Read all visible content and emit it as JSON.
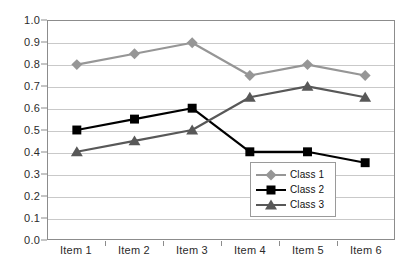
{
  "chart_data": {
    "type": "line",
    "title": "",
    "subtitle": "",
    "xlabel": "",
    "ylabel": "",
    "categories": [
      "Item 1",
      "Item 2",
      "Item 3",
      "Item 4",
      "Item 5",
      "Item 6"
    ],
    "ylim": [
      0.0,
      1.0
    ],
    "ytick_step": 0.1,
    "yticks": [
      "0.0",
      "0.1",
      "0.2",
      "0.3",
      "0.4",
      "0.5",
      "0.6",
      "0.7",
      "0.8",
      "0.9",
      "1.0"
    ],
    "ytick_values": [
      0.0,
      0.1,
      0.2,
      0.3,
      0.4,
      0.5,
      0.6,
      0.7,
      0.8,
      0.9,
      1.0
    ],
    "grid": true,
    "grid_axis": "y",
    "legend_position": "bottom-right-inside",
    "series": [
      {
        "name": "Class 1",
        "values": [
          0.8,
          0.85,
          0.9,
          0.75,
          0.8,
          0.75
        ],
        "color": "#969696",
        "marker": "diamond"
      },
      {
        "name": "Class 2",
        "values": [
          0.5,
          0.55,
          0.6,
          0.4,
          0.4,
          0.35
        ],
        "color": "#000000",
        "marker": "square"
      },
      {
        "name": "Class 3",
        "values": [
          0.4,
          0.45,
          0.5,
          0.65,
          0.7,
          0.65
        ],
        "color": "#585858",
        "marker": "triangle"
      }
    ]
  },
  "axes": {
    "border_color": "#8c8c8c",
    "grid_color": "#c9c9c9",
    "background": "#ffffff",
    "tick_label_color": "#2b2b2b"
  },
  "legend": {
    "border_color": "#9a9a9a",
    "background": "#ffffff",
    "entries": [
      "Class 1",
      "Class 2",
      "Class 3"
    ]
  }
}
